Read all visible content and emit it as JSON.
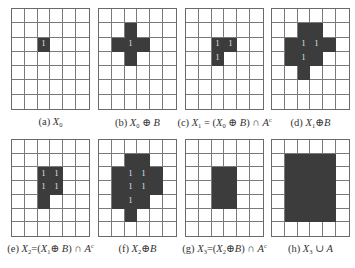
{
  "figure": {
    "rows": 7,
    "cols": 6,
    "colors": {
      "filled": "#3c3c3c",
      "grid_line": "#7a7a7a",
      "background": "#ffffff",
      "label_text": "#e8e8e8"
    },
    "panels": [
      {
        "id": "a",
        "caption_prefix": "(a) ",
        "caption_html": "<i>X</i><sub>0</sub>",
        "caption": "(a) X0",
        "filled": [
          [
            2,
            2
          ]
        ],
        "ones": [
          [
            2,
            2
          ]
        ]
      },
      {
        "id": "b",
        "caption_prefix": "(b) ",
        "caption_html": "<i>X</i><sub>0</sub> ⊕ <i>B</i>",
        "caption": "(b) X0 ⊕ B",
        "filled": [
          [
            1,
            2
          ],
          [
            2,
            1
          ],
          [
            2,
            2
          ],
          [
            2,
            3
          ],
          [
            3,
            2
          ]
        ],
        "ones": [
          [
            2,
            2
          ]
        ]
      },
      {
        "id": "c",
        "caption_prefix": "(c) ",
        "caption_html": "<i>X</i><sub>1</sub> = (<i>X</i><sub>0</sub> ⊕ <i>B</i>) ∩ <i>A</i><sup>c</sup>",
        "caption": "(c) X1 = (X0 ⊕ B) ∩ A^c",
        "filled": [
          [
            2,
            2
          ],
          [
            2,
            3
          ],
          [
            3,
            2
          ]
        ],
        "ones": [
          [
            2,
            2
          ],
          [
            2,
            3
          ],
          [
            3,
            2
          ]
        ]
      },
      {
        "id": "d",
        "caption_prefix": "(d) ",
        "caption_html": "<i>X</i><sub>1</sub>⊕<i>B</i>",
        "caption": "(d) X1⊕B",
        "filled": [
          [
            1,
            2
          ],
          [
            1,
            3
          ],
          [
            2,
            1
          ],
          [
            2,
            2
          ],
          [
            2,
            3
          ],
          [
            2,
            4
          ],
          [
            3,
            1
          ],
          [
            3,
            2
          ],
          [
            3,
            3
          ],
          [
            4,
            2
          ]
        ],
        "ones": [
          [
            2,
            2
          ],
          [
            2,
            3
          ],
          [
            3,
            2
          ]
        ]
      },
      {
        "id": "e",
        "caption_prefix": "(e) ",
        "caption_html": "<i>X</i><sub>2</sub>=(<i>X</i><sub>1</sub>⊕ <i>B</i>) ∩ <i>A</i><sup>c</sup>",
        "caption": "(e) X2=(X1⊕ B) ∩ A^c",
        "filled": [
          [
            2,
            2
          ],
          [
            2,
            3
          ],
          [
            3,
            2
          ],
          [
            3,
            3
          ],
          [
            4,
            2
          ]
        ],
        "ones": [
          [
            2,
            2
          ],
          [
            2,
            3
          ],
          [
            3,
            2
          ],
          [
            3,
            3
          ]
        ]
      },
      {
        "id": "f",
        "caption_prefix": "(f) ",
        "caption_html": "<i>X</i><sub>2</sub>⊕<i>B</i>",
        "caption": "(f) X2⊕B",
        "filled": [
          [
            1,
            2
          ],
          [
            1,
            3
          ],
          [
            2,
            1
          ],
          [
            2,
            2
          ],
          [
            2,
            3
          ],
          [
            2,
            4
          ],
          [
            3,
            1
          ],
          [
            3,
            2
          ],
          [
            3,
            3
          ],
          [
            3,
            4
          ],
          [
            4,
            1
          ],
          [
            4,
            2
          ],
          [
            4,
            3
          ],
          [
            5,
            2
          ]
        ],
        "ones": [
          [
            2,
            2
          ],
          [
            2,
            3
          ],
          [
            3,
            2
          ],
          [
            3,
            3
          ],
          [
            4,
            2
          ]
        ]
      },
      {
        "id": "g",
        "caption_prefix": "(g) ",
        "caption_html": "<i>X</i><sub>3</sub>=(<i>X</i><sub>2</sub>⊕<i>B</i>) ∩ <i>A</i><sup>c</sup>",
        "caption": "(g) X3=(X2⊕B) ∩ A^c",
        "filled": [
          [
            2,
            2
          ],
          [
            2,
            3
          ],
          [
            3,
            2
          ],
          [
            3,
            3
          ],
          [
            4,
            2
          ],
          [
            4,
            3
          ]
        ],
        "ones": []
      },
      {
        "id": "h",
        "caption_prefix": "(h) ",
        "caption_html": "<i>X</i><sub>3</sub> ∪ <i>A</i>",
        "caption": "(h) X3 ∪ A",
        "filled": [
          [
            1,
            1
          ],
          [
            1,
            2
          ],
          [
            1,
            3
          ],
          [
            1,
            4
          ],
          [
            2,
            1
          ],
          [
            2,
            2
          ],
          [
            2,
            3
          ],
          [
            2,
            4
          ],
          [
            3,
            1
          ],
          [
            3,
            2
          ],
          [
            3,
            3
          ],
          [
            3,
            4
          ],
          [
            4,
            1
          ],
          [
            4,
            2
          ],
          [
            4,
            3
          ],
          [
            4,
            4
          ],
          [
            5,
            1
          ],
          [
            5,
            2
          ],
          [
            5,
            3
          ],
          [
            5,
            4
          ]
        ],
        "ones": []
      }
    ],
    "cell_label": "1"
  }
}
